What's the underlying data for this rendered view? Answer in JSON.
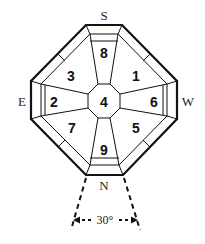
{
  "diagram": {
    "type": "octagonal-bagua-layout",
    "directions": {
      "top": "S",
      "bottom": "N",
      "left": "E",
      "right": "W"
    },
    "sectors": [
      {
        "position": "top",
        "label": "8"
      },
      {
        "position": "top-right",
        "label": "1"
      },
      {
        "position": "right",
        "label": "6"
      },
      {
        "position": "bottom-right",
        "label": "5"
      },
      {
        "position": "bottom",
        "label": "9"
      },
      {
        "position": "bottom-left",
        "label": "7"
      },
      {
        "position": "left",
        "label": "2"
      },
      {
        "position": "top-left",
        "label": "3"
      }
    ],
    "center": {
      "label": "4"
    },
    "angle_annotation": "30°",
    "colors": {
      "line": "#111111",
      "background": "#ffffff"
    }
  }
}
